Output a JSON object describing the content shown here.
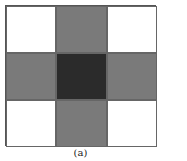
{
  "figure": {
    "caption": "(a)",
    "grid": {
      "rows": 3,
      "cols": 3,
      "colors": {
        "empty": "#ffffff",
        "arm": "#7a7a7a",
        "center": "#2b2b2b"
      },
      "cells": [
        [
          "empty",
          "arm",
          "empty"
        ],
        [
          "arm",
          "center",
          "arm"
        ],
        [
          "empty",
          "arm",
          "empty"
        ]
      ]
    }
  }
}
